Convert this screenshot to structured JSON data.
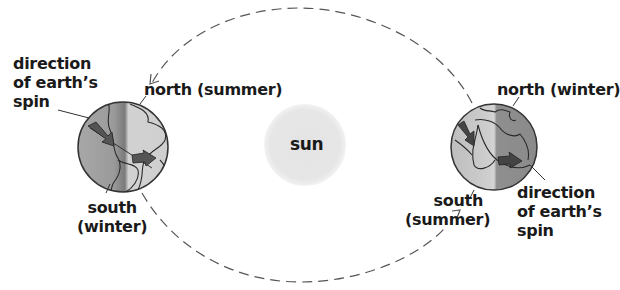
{
  "diagram": {
    "sun": {
      "label": "sun",
      "color": "#e6e6e6"
    },
    "left_earth": {
      "north_label": "north (summer)",
      "south_label_line1": "south",
      "south_label_line2": "(winter)",
      "spin_label_line1": "direction",
      "spin_label_line2": "of earth’s",
      "spin_label_line3": "spin"
    },
    "right_earth": {
      "north_label": "north (winter)",
      "south_label_line1": "south",
      "south_label_line2": "(summer)",
      "spin_label_line1": "direction",
      "spin_label_line2": "of earth’s",
      "spin_label_line3": "spin"
    },
    "orbit": {
      "style": "dashed",
      "direction": "counterclockwise-top"
    },
    "colors": {
      "text": "#1a1a1a",
      "orbit": "#555555",
      "earth_light": "#d9d9d9",
      "earth_dark": "#8a8a8a",
      "arrow": "#555555"
    }
  }
}
